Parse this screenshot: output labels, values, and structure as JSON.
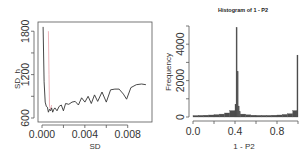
{
  "chart_data": [
    {
      "type": "line",
      "title": "",
      "xlabel": "SD",
      "ylabel": "SD_h",
      "xlim": [
        0.0,
        0.0098
      ],
      "ylim": [
        600,
        1900
      ],
      "xticks": [
        "0.000",
        "0.004",
        "0.008"
      ],
      "yticks": [
        "600",
        "1200",
        "1800"
      ],
      "grid": false,
      "legend": null,
      "series": [
        {
          "name": "SD_h (black)",
          "color": "#333333",
          "x": [
            0.0001,
            0.0002,
            0.0003,
            0.0004,
            0.0005,
            0.0006,
            0.0007,
            0.0008,
            0.0009,
            0.001,
            0.0011,
            0.0012,
            0.0014,
            0.0016,
            0.0018,
            0.002,
            0.0022,
            0.0025,
            0.0028,
            0.0031,
            0.0034,
            0.0037,
            0.004,
            0.0043,
            0.0046,
            0.0049,
            0.0052,
            0.0056,
            0.006,
            0.0064,
            0.0068,
            0.0072,
            0.0076,
            0.0079,
            0.0083,
            0.0088,
            0.0093,
            0.0097
          ],
          "values": [
            1860,
            1100,
            820,
            760,
            750,
            680,
            720,
            700,
            740,
            680,
            720,
            740,
            700,
            760,
            780,
            700,
            800,
            790,
            820,
            830,
            780,
            880,
            820,
            900,
            800,
            920,
            830,
            960,
            820,
            990,
            1000,
            1000,
            930,
            860,
            1020,
            1060,
            1070,
            1060
          ]
        },
        {
          "name": "reference (pink)",
          "color": "#e8a0a8",
          "x": [
            0.0006,
            0.00065,
            0.0007,
            0.0008,
            0.0009
          ],
          "values": [
            1800,
            1200,
            760,
            720,
            780
          ]
        }
      ]
    },
    {
      "type": "bar",
      "title": "Histogram of 1 - P2",
      "xlabel": "1 - P2",
      "ylabel": "Frequency",
      "xlim": [
        0.0,
        1.0
      ],
      "ylim": [
        0,
        5000
      ],
      "xticks": [
        "0.0",
        "0.4",
        "0.8"
      ],
      "yticks": [
        "0",
        "2000",
        "4000"
      ],
      "grid": false,
      "legend": null,
      "categories": [
        "0.00-0.05",
        "0.05-0.10",
        "0.10-0.15",
        "0.15-0.20",
        "0.20-0.25",
        "0.25-0.30",
        "0.30-0.35",
        "0.35-0.40",
        "0.40-0.41",
        "0.41-0.42",
        "0.42-0.43",
        "0.43-0.44",
        "0.44-0.45",
        "0.45-0.50",
        "0.50-0.55",
        "0.55-0.60",
        "0.60-0.65",
        "0.65-0.70",
        "0.70-0.75",
        "0.75-0.80",
        "0.80-0.85",
        "0.85-0.90",
        "0.90-0.95",
        "0.95-0.99",
        "0.99-1.00"
      ],
      "values": [
        80,
        90,
        100,
        110,
        130,
        160,
        220,
        350,
        700,
        4900,
        2500,
        600,
        300,
        160,
        120,
        100,
        90,
        90,
        90,
        100,
        110,
        140,
        180,
        350,
        3400
      ],
      "color": "#4d4d4d"
    }
  ],
  "panels": {
    "left": {
      "xlabel": "SD",
      "ylabel": "SD_h",
      "xticks": [
        "0.000",
        "0.004",
        "0.008"
      ],
      "yticks": [
        "600",
        "1200",
        "1800"
      ]
    },
    "right": {
      "title": "Histogram of 1 - P2",
      "xlabel": "1 - P2",
      "ylabel": "Frequency",
      "xticks": [
        "0.0",
        "0.4",
        "0.8"
      ],
      "yticks": [
        "0",
        "2000",
        "4000"
      ]
    }
  }
}
